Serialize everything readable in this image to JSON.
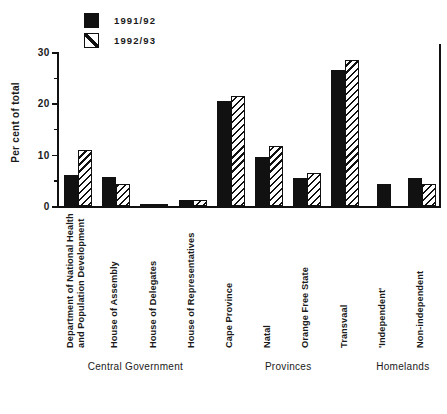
{
  "chart_data": {
    "type": "bar",
    "title": "",
    "subtitle": "",
    "xlabel": "",
    "ylabel": "Per cent of total",
    "ylim": [
      0,
      30
    ],
    "yticks": [
      0,
      10,
      20,
      30
    ],
    "yticks_minor": [
      5,
      15,
      25
    ],
    "grid": false,
    "legend_position": "top-left",
    "categories": [
      "Department of National Health and Population Development",
      "House of Assembly",
      "House of Delegates",
      "House of Representatives",
      "Cape Province",
      "Natal",
      "Orange Free State",
      "Transvaal",
      "'Independent'",
      "Non-independent"
    ],
    "series": [
      {
        "name": "1991/92",
        "color": "#111111",
        "fill": "solid",
        "values": [
          6.1,
          5.6,
          0.3,
          1.1,
          20.5,
          9.6,
          5.4,
          26.5,
          4.2,
          5.4
        ]
      },
      {
        "name": "1992/93",
        "color": "#ffffff",
        "fill": "diagonal-hatch",
        "values": [
          11.0,
          4.2,
          0.4,
          1.2,
          21.5,
          11.6,
          6.5,
          28.5,
          null,
          4.2
        ]
      }
    ],
    "group_brackets": [
      {
        "label": "Central Government",
        "categories": [
          0,
          1,
          2,
          3
        ]
      },
      {
        "label": "Provinces",
        "categories": [
          4,
          5,
          6,
          7
        ]
      },
      {
        "label": "Homelands",
        "categories": [
          8,
          9
        ]
      }
    ]
  },
  "axis": {
    "y_title": "Per cent of total",
    "tick_30": "30",
    "tick_20": "20",
    "tick_10": "10",
    "tick_0": "0"
  },
  "legend": {
    "items": [
      {
        "label": "1991/92",
        "swatch": "solid-black-square"
      },
      {
        "label": "1992/93",
        "swatch": "hatched-white-square"
      }
    ]
  },
  "category_labels": [
    {
      "line1": "Department of National Health",
      "line2": "and Population Development"
    },
    {
      "line1": "House of Assembly",
      "line2": ""
    },
    {
      "line1": "House of Delegates",
      "line2": ""
    },
    {
      "line1": "House of Representatives",
      "line2": ""
    },
    {
      "line1": "Cape Province",
      "line2": ""
    },
    {
      "line1": "Natal",
      "line2": ""
    },
    {
      "line1": "Orange Free State",
      "line2": ""
    },
    {
      "line1": "Transvaal",
      "line2": ""
    },
    {
      "line1": "'Independent'",
      "line2": ""
    },
    {
      "line1": "Non-independent",
      "line2": ""
    }
  ],
  "group_labels": [
    "Central Government",
    "Provinces",
    "Homelands"
  ],
  "caption": {
    "text": ""
  }
}
